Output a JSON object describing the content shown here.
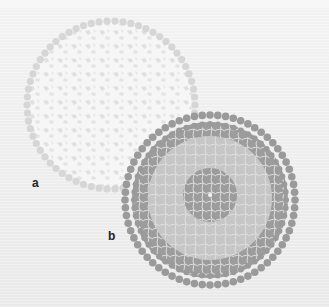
{
  "figure": {
    "panels": [
      {
        "id": "a",
        "label": "a",
        "description": "Light circular mosaic structure with outer ring of beads",
        "center": [
          111,
          105
        ],
        "radius": 88,
        "colors": {
          "beads": "#d6d6d6",
          "fill": "#f7f7f7",
          "fragments": "#e2e2e2"
        }
      },
      {
        "id": "b",
        "label": "b",
        "description": "Concentric circular mosaic with dark outer band, light middle band and dark core",
        "center": [
          210,
          200
        ],
        "radius": 88,
        "colors": {
          "beads": "#9a9a9a",
          "outer_band": "#9d9d9d",
          "middle_band": "#c4c4c4",
          "core": "#9a9a9a",
          "lines": "#e6e6e6"
        }
      }
    ],
    "background": "#ececec"
  }
}
